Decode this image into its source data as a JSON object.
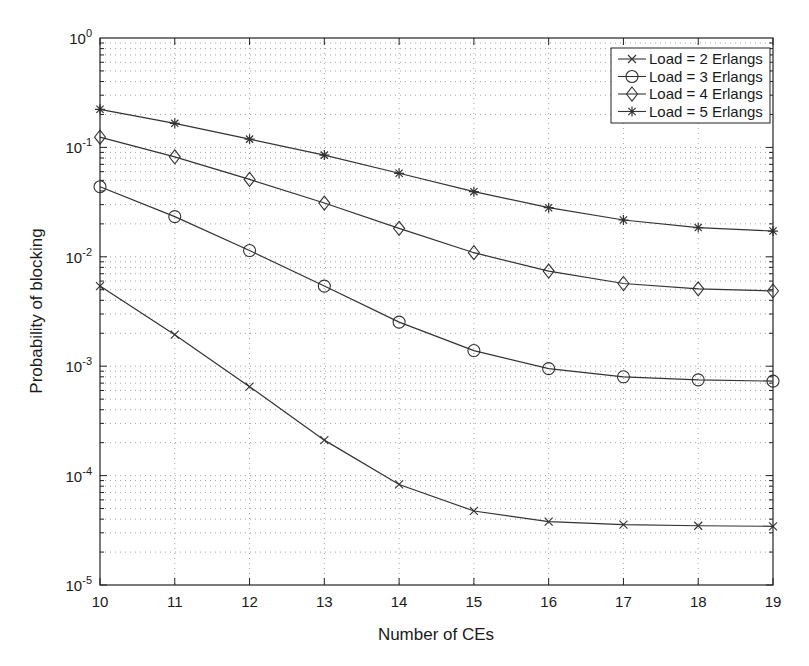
{
  "chart_data": {
    "type": "line",
    "title": "",
    "xlabel": "Number of CEs",
    "ylabel": "Probability of blocking",
    "yscale": "log",
    "xlim": [
      10,
      19
    ],
    "ylim": [
      1e-05,
      1
    ],
    "grid": true,
    "legend_position": "upper right",
    "x": [
      10,
      11,
      12,
      13,
      14,
      15,
      16,
      17,
      18,
      19
    ],
    "x_tick_labels": [
      "10",
      "11",
      "12",
      "13",
      "14",
      "15",
      "16",
      "17",
      "18",
      "19"
    ],
    "y_tick_labels": [
      {
        "base": "10",
        "exp": "0",
        "value": 1
      },
      {
        "base": "10",
        "exp": "-1",
        "value": 0.1
      },
      {
        "base": "10",
        "exp": "-2",
        "value": 0.01
      },
      {
        "base": "10",
        "exp": "-3",
        "value": 0.001
      },
      {
        "base": "10",
        "exp": "-4",
        "value": 0.0001
      },
      {
        "base": "10",
        "exp": "-5",
        "value": 1e-05
      }
    ],
    "series": [
      {
        "name": "Load = 2 Erlangs",
        "marker": "x",
        "values": [
          0.0054,
          0.00194,
          0.00065,
          0.000211,
          8.3e-05,
          4.75e-05,
          3.8e-05,
          3.56e-05,
          3.48e-05,
          3.44e-05
        ]
      },
      {
        "name": "Load = 3 Erlangs",
        "marker": "o",
        "values": [
          0.0437,
          0.0233,
          0.0114,
          0.0054,
          0.00253,
          0.00139,
          0.00095,
          0.0008,
          0.00075,
          0.00073
        ]
      },
      {
        "name": "Load = 4 Erlangs",
        "marker": "d",
        "values": [
          0.124,
          0.082,
          0.051,
          0.031,
          0.0182,
          0.0109,
          0.0074,
          0.0057,
          0.0051,
          0.00487
        ]
      },
      {
        "name": "Load = 5 Erlangs",
        "marker": "*",
        "values": [
          0.223,
          0.166,
          0.119,
          0.085,
          0.058,
          0.0394,
          0.0281,
          0.0217,
          0.0185,
          0.0172
        ]
      }
    ]
  },
  "colors": {
    "line": "#333333",
    "axis": "#222222",
    "grid": "#8a8a8a",
    "background": "#ffffff"
  }
}
